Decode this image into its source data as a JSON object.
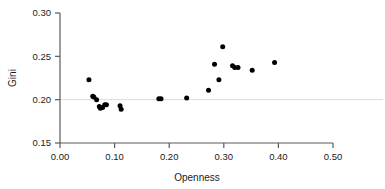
{
  "chart_data": {
    "type": "scatter",
    "title": "",
    "xlabel": "Openness",
    "ylabel": "Gini",
    "xlim": [
      0.0,
      0.5
    ],
    "ylim": [
      0.15,
      0.3
    ],
    "xticks": [
      "0.00",
      "0.10",
      "0.20",
      "0.30",
      "0.40",
      "0.50"
    ],
    "xtick_values": [
      0.0,
      0.1,
      0.2,
      0.3,
      0.4,
      0.5
    ],
    "yticks": [
      "0.15",
      "0.20",
      "0.25",
      "0.30"
    ],
    "ytick_values": [
      0.15,
      0.2,
      0.25,
      0.3
    ],
    "grid": "horizontal gridline at y=0.20 only",
    "gridline_values": [
      0.2
    ],
    "legend": "none",
    "marker": "filled black circle",
    "points": [
      {
        "x": 0.053,
        "y": 0.223
      },
      {
        "x": 0.06,
        "y": 0.204
      },
      {
        "x": 0.062,
        "y": 0.203
      },
      {
        "x": 0.067,
        "y": 0.2
      },
      {
        "x": 0.072,
        "y": 0.192
      },
      {
        "x": 0.074,
        "y": 0.19
      },
      {
        "x": 0.078,
        "y": 0.191
      },
      {
        "x": 0.082,
        "y": 0.194
      },
      {
        "x": 0.085,
        "y": 0.194
      },
      {
        "x": 0.11,
        "y": 0.193
      },
      {
        "x": 0.112,
        "y": 0.189
      },
      {
        "x": 0.181,
        "y": 0.201
      },
      {
        "x": 0.185,
        "y": 0.201
      },
      {
        "x": 0.232,
        "y": 0.202
      },
      {
        "x": 0.272,
        "y": 0.211
      },
      {
        "x": 0.283,
        "y": 0.241
      },
      {
        "x": 0.291,
        "y": 0.223
      },
      {
        "x": 0.298,
        "y": 0.261
      },
      {
        "x": 0.316,
        "y": 0.239
      },
      {
        "x": 0.32,
        "y": 0.237
      },
      {
        "x": 0.326,
        "y": 0.237
      },
      {
        "x": 0.352,
        "y": 0.234
      },
      {
        "x": 0.393,
        "y": 0.243
      }
    ]
  },
  "axes": {
    "x_title": "Openness",
    "y_title": "Gini"
  }
}
